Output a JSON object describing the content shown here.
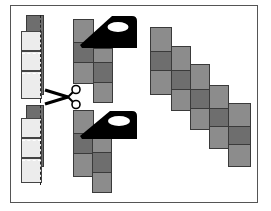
{
  "diagram": {
    "colors": {
      "light_fabric": "#ececec",
      "mid_fabric": "#8c8c8c",
      "dark_fabric": "#6e6e6e",
      "iron": "#000000",
      "frame": "#555555"
    },
    "steps": [
      {
        "name": "sewn-strip-set",
        "icon": "dashed-seam-strip"
      },
      {
        "name": "cut",
        "icon": "scissors-icon"
      },
      {
        "name": "press",
        "icon": "iron-icon"
      },
      {
        "name": "join-diagonal",
        "icon": "staircase-squares"
      }
    ],
    "staircase_columns": 5
  }
}
